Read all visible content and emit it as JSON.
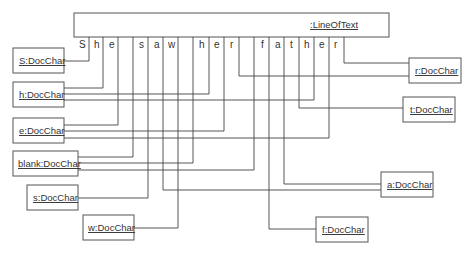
{
  "diagram": {
    "type": "UML object diagram",
    "container": {
      "label": ":LineOfText"
    },
    "characters": [
      "S",
      "h",
      "e",
      " ",
      "s",
      "a",
      "w",
      " ",
      "h",
      "e",
      "r",
      " ",
      "f",
      "a",
      "t",
      "h",
      "e",
      "r"
    ],
    "objects": [
      {
        "id": "S",
        "label": "S:DocChar"
      },
      {
        "id": "h",
        "label": "h:DocChar"
      },
      {
        "id": "e",
        "label": "e:DocChar"
      },
      {
        "id": "blank",
        "label": "blank:DocChar"
      },
      {
        "id": "s",
        "label": "s:DocChar"
      },
      {
        "id": "w",
        "label": "w:DocChar"
      },
      {
        "id": "r",
        "label": "r:DocChar"
      },
      {
        "id": "t",
        "label": "t:DocChar"
      },
      {
        "id": "a",
        "label": "a:DocChar"
      },
      {
        "id": "f",
        "label": "f:DocChar"
      }
    ],
    "links": [
      {
        "char_index": 0,
        "to": "S"
      },
      {
        "char_index": 1,
        "to": "h"
      },
      {
        "char_index": 2,
        "to": "e"
      },
      {
        "char_index": 3,
        "to": "blank"
      },
      {
        "char_index": 4,
        "to": "s"
      },
      {
        "char_index": 5,
        "to": "a"
      },
      {
        "char_index": 6,
        "to": "w"
      },
      {
        "char_index": 7,
        "to": "blank"
      },
      {
        "char_index": 8,
        "to": "h"
      },
      {
        "char_index": 9,
        "to": "e"
      },
      {
        "char_index": 10,
        "to": "r"
      },
      {
        "char_index": 11,
        "to": "blank"
      },
      {
        "char_index": 12,
        "to": "f"
      },
      {
        "char_index": 13,
        "to": "a"
      },
      {
        "char_index": 14,
        "to": "t"
      },
      {
        "char_index": 15,
        "to": "h"
      },
      {
        "char_index": 16,
        "to": "e"
      },
      {
        "char_index": 17,
        "to": "r"
      }
    ]
  }
}
